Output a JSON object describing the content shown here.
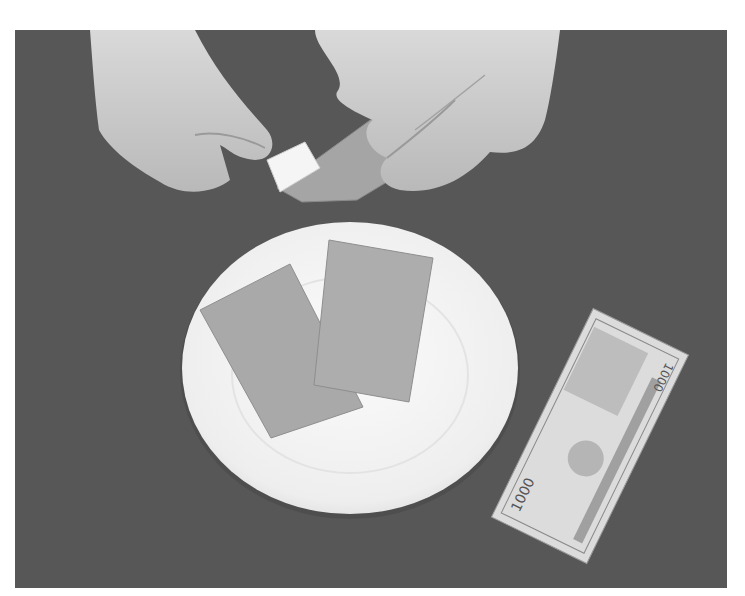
{
  "image": {
    "description": "Black-and-white photograph: two hands fold a small white paper inside a larger grey paper over a dark table; a white plate holds two rectangular grey papers; a 1000 banknote lies to the right of the plate.",
    "tone": "grayscale",
    "colors": {
      "table": "#575757",
      "plate": "#f4f4f4",
      "paper": "#a8a8a8",
      "skin": "#cfcfcf",
      "banknote": "#d8d8d8"
    }
  },
  "banknote": {
    "denomination": "1000",
    "corner_text": "1000",
    "serial": "B881145068"
  }
}
